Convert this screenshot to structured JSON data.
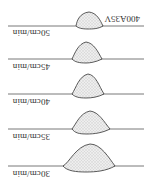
{
  "figure": {
    "orientation": "rotated-180",
    "header_label": "400A35V",
    "rows": [
      {
        "speed_label": "30cm/min"
      },
      {
        "speed_label": "35cm/min"
      },
      {
        "speed_label": "40cm/min"
      },
      {
        "speed_label": "45cm/min"
      },
      {
        "speed_label": "50cm/min"
      }
    ],
    "colors": {
      "line": "#555555",
      "bead_fill": "#e6e6e6",
      "bead_stroke": "#333333",
      "text": "#333333"
    }
  }
}
